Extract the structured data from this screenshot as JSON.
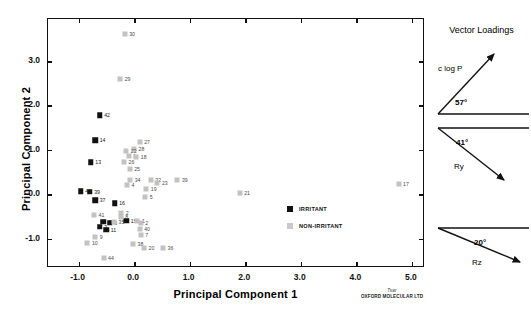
{
  "chart_data": {
    "type": "scatter",
    "title": "",
    "xlabel": "Principal Component 1",
    "ylabel": "Principal Component 2",
    "xlim": [
      -1.55,
      5.2
    ],
    "ylim": [
      -1.62,
      3.95
    ],
    "xticks": [
      -1.0,
      0.0,
      1.0,
      2.0,
      3.0,
      4.0,
      5.0
    ],
    "xtick_labels": [
      "-1.0",
      "0.0",
      "1.0",
      "2.0",
      "3.0",
      "4.0",
      "5.0"
    ],
    "yticks": [
      -1.0,
      0.0,
      1.0,
      2.0,
      3.0
    ],
    "ytick_labels": [
      "-1.0",
      "0.0",
      "1.0",
      "2.0",
      "3.0"
    ],
    "grid": false,
    "legend_position": "inside-right",
    "series": [
      {
        "name": "IRRITANT",
        "color": "#111111",
        "marker": "filled-square",
        "points": [
          {
            "label": "42",
            "x": -0.62,
            "y": 1.78
          },
          {
            "label": "14",
            "x": -0.7,
            "y": 1.22
          },
          {
            "label": "13",
            "x": -0.78,
            "y": 0.72
          },
          {
            "label": "46",
            "x": -0.96,
            "y": 0.07
          },
          {
            "label": "39",
            "x": -0.8,
            "y": 0.06
          },
          {
            "label": "37",
            "x": -0.7,
            "y": -0.14
          },
          {
            "label": "16",
            "x": -0.35,
            "y": -0.21
          },
          {
            "label": "43",
            "x": -0.56,
            "y": -0.62
          },
          {
            "label": "6",
            "x": -0.44,
            "y": -0.64
          },
          {
            "label": "3",
            "x": -0.62,
            "y": -0.74
          },
          {
            "label": "11",
            "x": -0.5,
            "y": -0.8
          },
          {
            "label": "15",
            "x": -0.14,
            "y": -0.6
          }
        ]
      },
      {
        "name": "NON-IRRITANT",
        "color": "#c2c2c2",
        "marker": "filled-square",
        "points": [
          {
            "label": "30",
            "x": -0.17,
            "y": 3.62
          },
          {
            "label": "29",
            "x": -0.25,
            "y": 2.6
          },
          {
            "label": "27",
            "x": 0.1,
            "y": 1.18
          },
          {
            "label": "28",
            "x": 0.0,
            "y": 1.02
          },
          {
            "label": "22",
            "x": -0.14,
            "y": 0.98
          },
          {
            "label": "1",
            "x": -0.1,
            "y": 0.85
          },
          {
            "label": "18",
            "x": 0.04,
            "y": 0.84
          },
          {
            "label": "26",
            "x": -0.18,
            "y": 0.72
          },
          {
            "label": "25",
            "x": -0.08,
            "y": 0.57
          },
          {
            "label": "34",
            "x": -0.07,
            "y": 0.33
          },
          {
            "label": "32",
            "x": 0.3,
            "y": 0.31
          },
          {
            "label": "23",
            "x": 0.42,
            "y": 0.25
          },
          {
            "label": "39",
            "x": 0.78,
            "y": 0.33
          },
          {
            "label": "4",
            "x": -0.13,
            "y": 0.2
          },
          {
            "label": "19",
            "x": 0.22,
            "y": 0.12
          },
          {
            "label": "5",
            "x": 0.2,
            "y": -0.06
          },
          {
            "label": "41",
            "x": -0.72,
            "y": -0.46
          },
          {
            "label": "2",
            "x": -0.23,
            "y": -0.43
          },
          {
            "label": "8",
            "x": -0.24,
            "y": -0.52
          },
          {
            "label": "35",
            "x": -0.36,
            "y": -0.62
          },
          {
            "label": "1",
            "x": 0.06,
            "y": -0.6
          },
          {
            "label": "2",
            "x": 0.12,
            "y": -0.66
          },
          {
            "label": "40",
            "x": 0.1,
            "y": -0.78
          },
          {
            "label": "7",
            "x": 0.12,
            "y": -0.92
          },
          {
            "label": "9",
            "x": -0.7,
            "y": -0.96
          },
          {
            "label": "10",
            "x": -0.84,
            "y": -1.1
          },
          {
            "label": "38",
            "x": -0.02,
            "y": -1.12
          },
          {
            "label": "20",
            "x": 0.18,
            "y": -1.22
          },
          {
            "label": "36",
            "x": 0.52,
            "y": -1.22
          },
          {
            "label": "44",
            "x": -0.55,
            "y": -1.44
          },
          {
            "label": "21",
            "x": 1.9,
            "y": 0.02
          },
          {
            "label": "17",
            "x": 4.76,
            "y": 0.22
          }
        ]
      }
    ]
  },
  "legend": {
    "items": [
      {
        "label": "IRRITANT",
        "swatch": "irritant"
      },
      {
        "label": "NON-IRRITANT",
        "swatch": "nonirritant"
      }
    ]
  },
  "vector_panel": {
    "title": "Vector Loadings",
    "vectors": [
      {
        "name": "c log P",
        "angle": "57°",
        "direction": "up-right"
      },
      {
        "name": "Ry",
        "angle": "41°",
        "direction": "down-right"
      },
      {
        "name": "Rz",
        "angle": "20°",
        "direction": "down-right"
      }
    ]
  },
  "footer": {
    "logo": "Tsar",
    "company": "OXFORD MOLECULAR LTD"
  }
}
